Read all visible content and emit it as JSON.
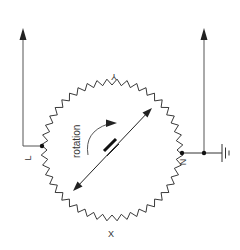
{
  "diagram": {
    "type": "rotary potentiometer (circular resistor with rotating wiper)",
    "labels": {
      "top": "Y",
      "left": "L",
      "right": "N",
      "bottom": "X",
      "rotation": "rotation"
    },
    "terminals": [
      {
        "id": "L",
        "description": "left tap, wired up to an output arrow"
      },
      {
        "id": "N",
        "description": "right tap, wired up to an output arrow and to ground"
      }
    ],
    "colors": {
      "line": "#222222",
      "wire": "#555555",
      "text": "#333333",
      "background": "#ffffff"
    }
  }
}
